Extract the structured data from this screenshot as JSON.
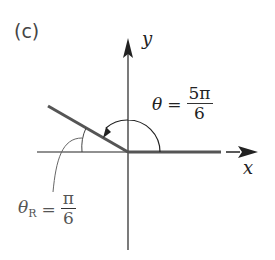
{
  "panel_label": "(c)",
  "axes": {
    "x_label": "x",
    "y_label": "y"
  },
  "angle": {
    "theta_symbol": "θ",
    "equals": "=",
    "numerator": "5π",
    "denominator": "6"
  },
  "reference_angle": {
    "theta_symbol": "θ",
    "subscript": "R",
    "equals": "=",
    "numerator": "π",
    "denominator": "6"
  },
  "colors": {
    "axis": "#222222",
    "ray": "#555555",
    "reference_label": "#555555"
  }
}
